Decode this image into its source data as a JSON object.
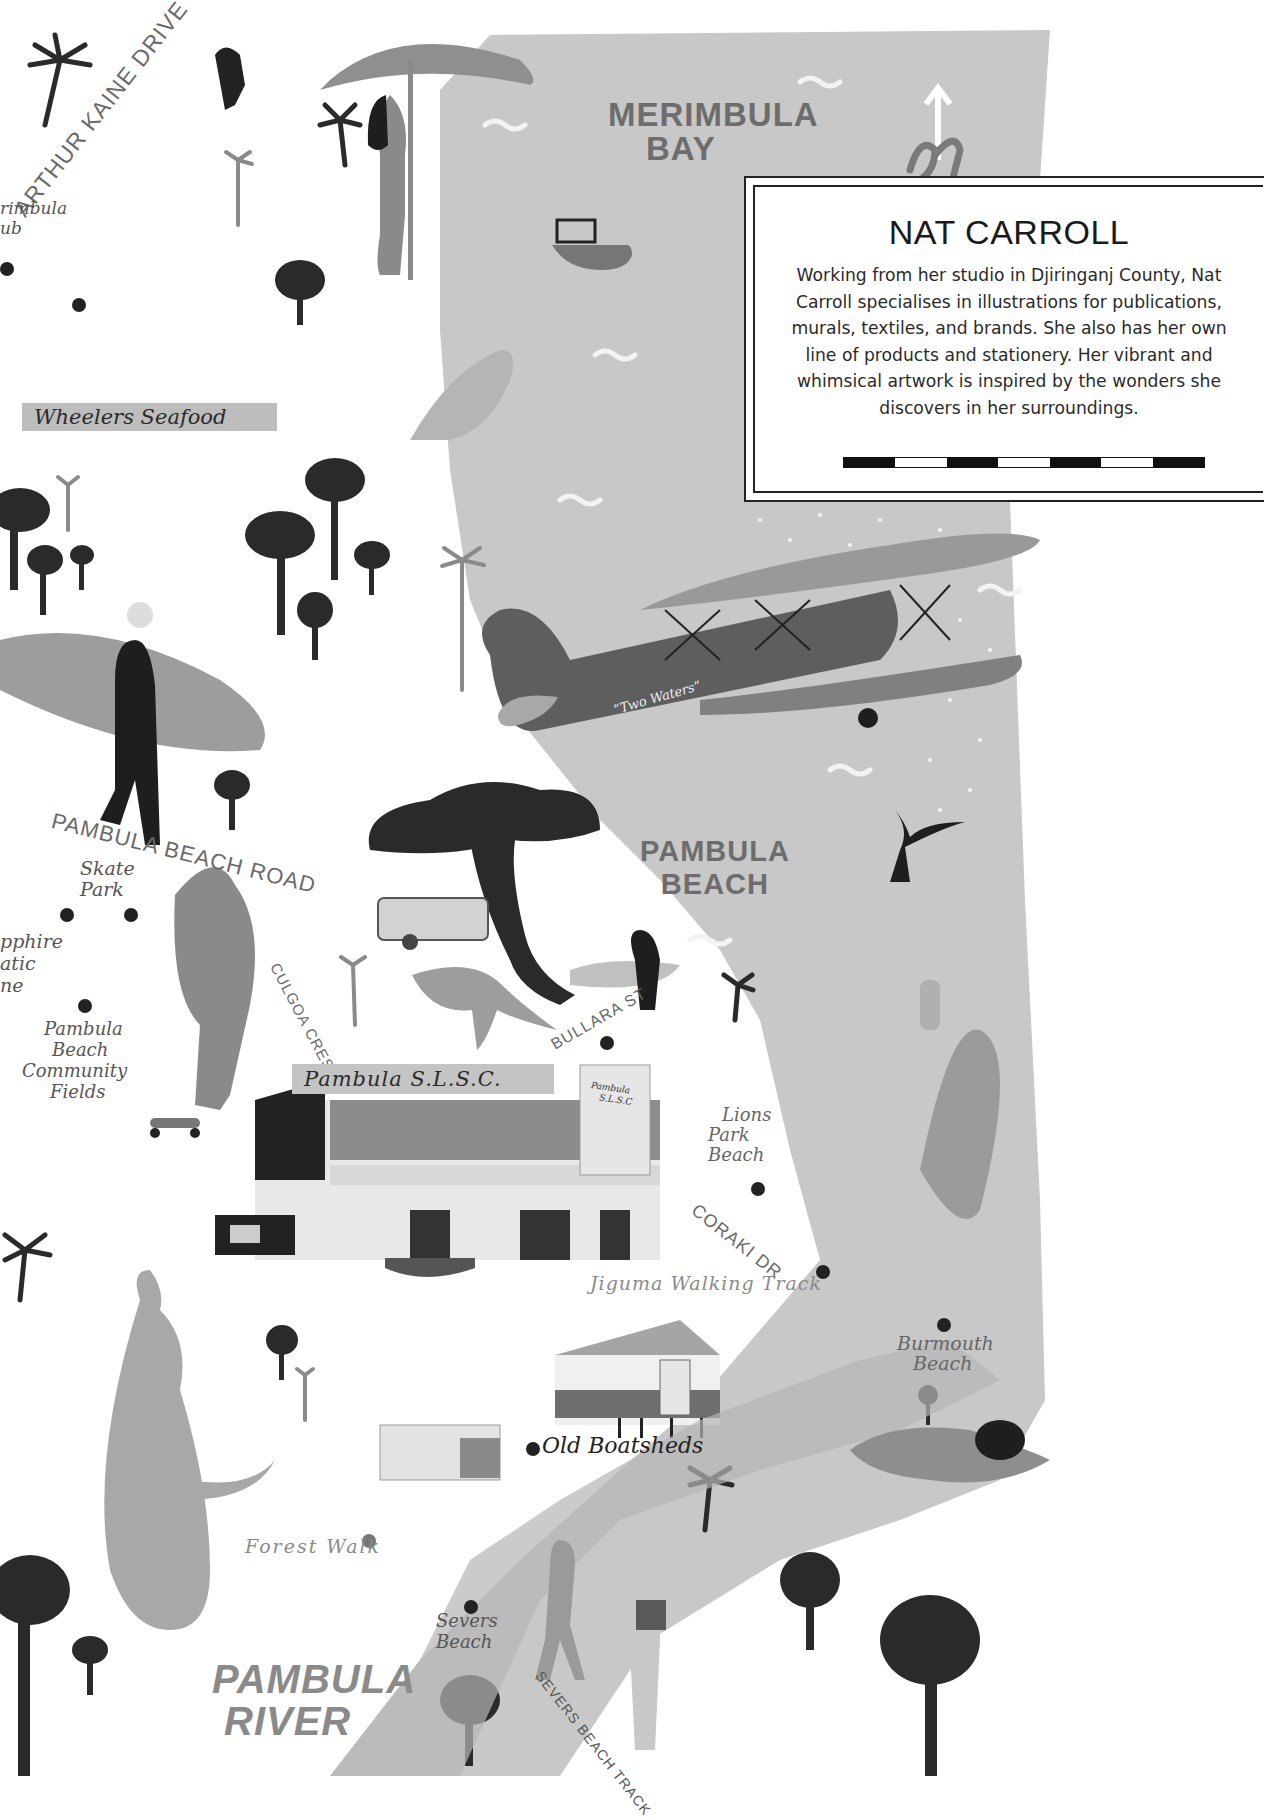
{
  "info_box": {
    "title": "NAT CARROLL",
    "bio": "Working from her studio in Djiringanj County, Nat Carroll specialises in illustrations for publications, murals, textiles, and brands. She also has her own line of products and stationery. Her vibrant and whimsical artwork is inspired by the wonders she discovers in her surroundings.",
    "scale_bar_segments": [
      "dark",
      "light",
      "dark",
      "light",
      "dark",
      "light",
      "dark"
    ]
  },
  "map_labels": {
    "merimbula_bay": [
      "MERIMBULA",
      "BAY"
    ],
    "north_arrow": "N",
    "arthur_kaine_drive": "ARTHUR KAINE DRIVE",
    "merimbula_club_partial": [
      "rimbula",
      "ub"
    ],
    "wheelers_seafood": "Wheelers Seafood",
    "plane_name": "“Two Waters”",
    "pambula_beach_road": "PAMBULA BEACH ROAD",
    "skate_park": [
      "Skate",
      "Park"
    ],
    "sapphire_aquatic_centre_partial": [
      "pphire",
      "atic",
      "ne"
    ],
    "pambula_beach_fields": [
      "Pambula",
      "Beach",
      "Community",
      "Fields"
    ],
    "pambula_beach": [
      "PAMBULA",
      "BEACH"
    ],
    "culgoa_cres": "CULGOA CRES",
    "bullara_st": "BULLARA ST",
    "pambula_slsc": "Pambula S.L.S.C.",
    "slsc_sign": [
      "Pambula",
      "S.L.S.C"
    ],
    "lions_park_beach": [
      "Lions",
      "Park",
      "Beach"
    ],
    "coraki_dr": "CORAKI DR",
    "jiguma_walking_track": "Jiguma Walking Track",
    "burmouth_beach": [
      "Burmouth",
      "Beach"
    ],
    "old_boatsheds": "Old Boatsheds",
    "forest_walk": "Forest Walk",
    "severs_beach": [
      "Severs",
      "Beach"
    ],
    "severs_beach_track": "SEVERS BEACH TRACK",
    "pambula_river": [
      "PAMBULA",
      "RIVER"
    ]
  },
  "colors": {
    "sea": "#c9c9c9",
    "land": "#ffffff",
    "ink": "#1f1f1f",
    "mid_gray": "#8a8a8a",
    "label_gray": "#6a6a6a"
  }
}
